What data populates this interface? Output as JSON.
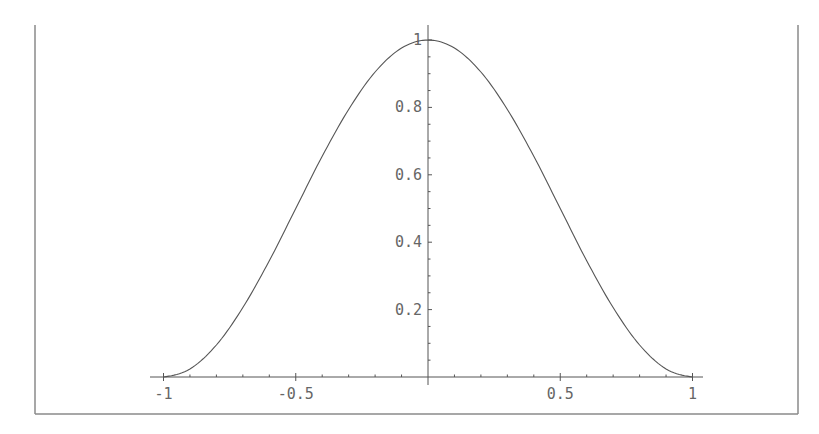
{
  "chart_data": {
    "type": "line",
    "title": "",
    "xlabel": "",
    "ylabel": "",
    "function_shape": "bell curve, zero at x=-1 and x=1, peak 1 at x=0 (approx. cos^2(pi*x/2))",
    "xlim": [
      -1.05,
      1.05
    ],
    "ylim": [
      0,
      1
    ],
    "grid": false,
    "legend": null,
    "x_ticks": [
      -1,
      -0.5,
      0.5,
      1
    ],
    "x_tick_labels": [
      "-1",
      "-0.5",
      "0.5",
      "1"
    ],
    "x_minor_tick_step": 0.1,
    "y_ticks": [
      0.2,
      0.4,
      0.6,
      0.8,
      1
    ],
    "y_tick_labels": [
      "0.2",
      "0.4",
      "0.6",
      "0.8",
      "1"
    ],
    "y_minor_tick_step": 0.05,
    "series": [
      {
        "name": "f(x)",
        "x": [
          -1,
          -0.9,
          -0.8,
          -0.7,
          -0.6,
          -0.5,
          -0.4,
          -0.3,
          -0.2,
          -0.1,
          0,
          0.1,
          0.2,
          0.3,
          0.4,
          0.5,
          0.6,
          0.7,
          0.8,
          0.9,
          1
        ],
        "y": [
          0,
          0.024,
          0.095,
          0.206,
          0.345,
          0.5,
          0.655,
          0.794,
          0.905,
          0.976,
          1,
          0.976,
          0.905,
          0.794,
          0.655,
          0.5,
          0.345,
          0.206,
          0.095,
          0.024,
          0
        ]
      }
    ]
  }
}
